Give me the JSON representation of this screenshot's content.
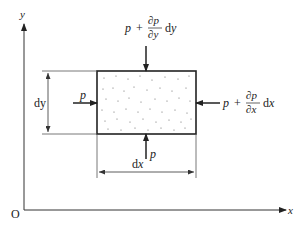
{
  "diagram": {
    "axes": {
      "origin_label": "O",
      "x_label": "x",
      "y_label": "y"
    },
    "element": {
      "fill_pattern": "stippled",
      "width_label": "dx",
      "height_label": "dy"
    },
    "forces": {
      "left": {
        "symbol": "p",
        "direction": "right"
      },
      "bottom": {
        "symbol": "p",
        "direction": "up"
      },
      "top": {
        "base": "p",
        "plus": "+",
        "numerator": "∂p",
        "denominator": "∂y",
        "suffix": "dy",
        "direction": "down"
      },
      "right": {
        "base": "p",
        "plus": "+",
        "numerator": "∂p",
        "denominator": "∂x",
        "suffix": "dx",
        "direction": "left"
      }
    },
    "colors": {
      "line": "#222222",
      "thin_line": "#555555",
      "background": "#ffffff"
    }
  }
}
